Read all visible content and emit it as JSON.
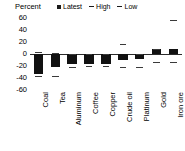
{
  "chart_data": {
    "type": "bar",
    "title": "",
    "xlabel": "",
    "ylabel": "Percent",
    "ylim": [
      -60,
      60
    ],
    "yticks": [
      60,
      40,
      20,
      0,
      -20,
      -40,
      -60
    ],
    "grid": false,
    "legend_position": "top",
    "zero_line": true,
    "categories": [
      "Coal",
      "Tea",
      "Aluminum",
      "Coffee",
      "Copper",
      "Crude oil",
      "Platinum",
      "Gold",
      "Iron ore"
    ],
    "series": [
      {
        "name": "Latest",
        "type": "bar",
        "values": [
          -33,
          -22,
          -17,
          -17,
          -16,
          -10,
          -9,
          8,
          8
        ]
      },
      {
        "name": "High",
        "type": "marker",
        "values": [
          3,
          1,
          0,
          0,
          0,
          17,
          0,
          8,
          57
        ]
      },
      {
        "name": "Low",
        "type": "marker",
        "values": [
          -37,
          -37,
          -22,
          -20,
          -20,
          -22,
          -22,
          -14,
          -13
        ]
      }
    ]
  },
  "legend": {
    "entries": [
      {
        "label": "Latest",
        "marker": "filled-square",
        "color": "#1a1a1a"
      },
      {
        "label": "High",
        "marker": "dash",
        "color": "#1a1a1a"
      },
      {
        "label": "Low",
        "marker": "dash",
        "color": "#1a1a1a"
      }
    ]
  },
  "axis": {
    "unit_title": "Percent",
    "ytick_labels": [
      "60",
      "40",
      "20",
      "0",
      "-20",
      "-40",
      "-60"
    ]
  },
  "colors": {
    "bar": "#111111",
    "marker": "#3a3a3a",
    "axis": "#2b2b2b",
    "background": "#ffffff",
    "text": "#000000"
  }
}
